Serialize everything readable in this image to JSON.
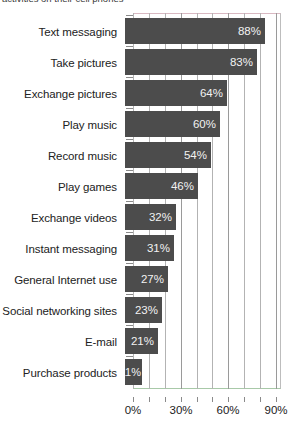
{
  "caption": {
    "clipped_line": "activities on their cell phones"
  },
  "chart_data": {
    "type": "bar",
    "orientation": "horizontal",
    "title": "",
    "xlabel": "",
    "ylabel": "",
    "xlim": [
      0,
      93
    ],
    "xticks": [
      0,
      10,
      20,
      30,
      40,
      50,
      60,
      70,
      80,
      90
    ],
    "xtick_labels": [
      "0%",
      "",
      "",
      "30%",
      "",
      "",
      "60%",
      "",
      "",
      "90%"
    ],
    "labeled_ticks": [
      "0%",
      "30%",
      "60%",
      "90%"
    ],
    "grid": true,
    "legend": false,
    "bar_color": "#4c4c4c",
    "value_label_color": "#f2f2f2",
    "categories": [
      "Text messaging",
      "Take pictures",
      "Exchange pictures",
      "Play music",
      "Record music",
      "Play games",
      "Exchange videos",
      "Instant messaging",
      "General Internet use",
      "Social networking sites",
      "E-mail",
      "Purchase products"
    ],
    "values": [
      88,
      83,
      64,
      60,
      54,
      46,
      32,
      31,
      27,
      23,
      21,
      11
    ],
    "value_labels": [
      "88%",
      "83%",
      "64%",
      "60%",
      "54%",
      "46%",
      "32%",
      "31%",
      "27%",
      "23%",
      "21%",
      "11%"
    ]
  }
}
